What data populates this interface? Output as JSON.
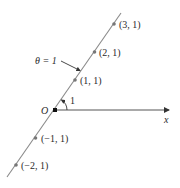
{
  "diagram": {
    "colors": {
      "line": "#8a8a8a",
      "axis": "#333333",
      "point": "#777777",
      "text": "#2a2a2a"
    },
    "origin_label": "O",
    "axis_label": "x",
    "angle_label": "1",
    "line_label": "θ = 1",
    "points": [
      {
        "label": "(3, 1)",
        "r": 3
      },
      {
        "label": "(2, 1)",
        "r": 2
      },
      {
        "label": "(1, 1)",
        "r": 1
      },
      {
        "label": "(−1, 1)",
        "r": -1
      },
      {
        "label": "(−2, 1)",
        "r": -2
      }
    ]
  }
}
